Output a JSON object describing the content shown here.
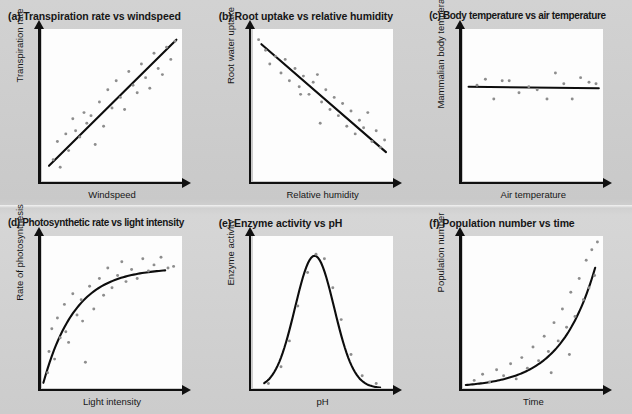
{
  "figure": {
    "background_color": "#cfcfcf",
    "plot_background_color": "#fdfdfd",
    "axis_color": "#101010",
    "dot_color": "#8d8d8d",
    "trend_color": "#0d0d0d"
  },
  "chart_data": [
    {
      "type": "scatter",
      "panel": "a",
      "title": "(a) Transpiration rate vs windspeed",
      "xlabel": "Windspeed",
      "ylabel": "Transpiration rate",
      "relationship": "positive linear",
      "grid": false,
      "legend": "none",
      "xlim": [
        0,
        100
      ],
      "ylim": [
        0,
        100
      ],
      "points": [
        [
          8,
          14
        ],
        [
          11,
          26
        ],
        [
          13,
          9
        ],
        [
          17,
          31
        ],
        [
          19,
          20
        ],
        [
          22,
          41
        ],
        [
          24,
          33
        ],
        [
          27,
          29
        ],
        [
          30,
          45
        ],
        [
          32,
          38
        ],
        [
          35,
          43
        ],
        [
          38,
          24
        ],
        [
          41,
          52
        ],
        [
          44,
          36
        ],
        [
          47,
          60
        ],
        [
          50,
          48
        ],
        [
          53,
          66
        ],
        [
          56,
          55
        ],
        [
          59,
          47
        ],
        [
          62,
          72
        ],
        [
          65,
          63
        ],
        [
          68,
          58
        ],
        [
          71,
          77
        ],
        [
          74,
          68
        ],
        [
          77,
          61
        ],
        [
          80,
          84
        ],
        [
          83,
          74
        ],
        [
          86,
          70
        ],
        [
          89,
          88
        ],
        [
          92,
          80
        ],
        [
          95,
          92
        ]
      ],
      "trend": {
        "kind": "line",
        "from": [
          5,
          10
        ],
        "to": [
          96,
          93
        ]
      }
    },
    {
      "type": "scatter",
      "panel": "b",
      "title": "(b) Root uptake vs relative humidity",
      "xlabel": "Relative humidity",
      "ylabel": "Root water uptake",
      "relationship": "negative linear",
      "grid": false,
      "legend": "none",
      "xlim": [
        0,
        100
      ],
      "ylim": [
        0,
        100
      ],
      "points": [
        [
          4,
          93
        ],
        [
          9,
          86
        ],
        [
          12,
          77
        ],
        [
          16,
          82
        ],
        [
          20,
          71
        ],
        [
          23,
          80
        ],
        [
          26,
          66
        ],
        [
          30,
          74
        ],
        [
          33,
          62
        ],
        [
          36,
          69
        ],
        [
          40,
          57
        ],
        [
          43,
          65
        ],
        [
          46,
          70
        ],
        [
          49,
          52
        ],
        [
          52,
          60
        ],
        [
          55,
          47
        ],
        [
          58,
          55
        ],
        [
          61,
          43
        ],
        [
          64,
          51
        ],
        [
          67,
          36
        ],
        [
          70,
          46
        ],
        [
          73,
          31
        ],
        [
          76,
          40
        ],
        [
          79,
          35
        ],
        [
          82,
          45
        ],
        [
          85,
          26
        ],
        [
          88,
          33
        ],
        [
          91,
          22
        ],
        [
          94,
          27
        ],
        [
          48,
          38
        ],
        [
          34,
          57
        ]
      ],
      "trend": {
        "kind": "line",
        "from": [
          6,
          90
        ],
        "to": [
          95,
          19
        ]
      }
    },
    {
      "type": "scatter",
      "panel": "c",
      "title": "(c) Body temperature vs air temperature",
      "xlabel": "Air temperature",
      "ylabel": "Mammalian body temperature",
      "relationship": "no correlation (constant)",
      "grid": false,
      "legend": "none",
      "xlim": [
        0,
        100
      ],
      "ylim": [
        0,
        100
      ],
      "points": [
        [
          10,
          63
        ],
        [
          16,
          67
        ],
        [
          22,
          54
        ],
        [
          28,
          66
        ],
        [
          33,
          66
        ],
        [
          40,
          58
        ],
        [
          47,
          62
        ],
        [
          53,
          60
        ],
        [
          60,
          54
        ],
        [
          66,
          71
        ],
        [
          72,
          64
        ],
        [
          78,
          54
        ],
        [
          84,
          68
        ],
        [
          90,
          65
        ],
        [
          95,
          64
        ]
      ],
      "trend": {
        "kind": "line",
        "from": [
          4,
          62
        ],
        "to": [
          97,
          61
        ]
      }
    },
    {
      "type": "scatter",
      "panel": "d",
      "title": "(d) Photosynthetic rate vs light intensity",
      "xlabel": "Light intensity",
      "ylabel": "Rate of photosynthesis",
      "relationship": "rises then plateaus (saturation)",
      "grid": false,
      "legend": "none",
      "xlim": [
        0,
        100
      ],
      "ylim": [
        0,
        100
      ],
      "points": [
        [
          4,
          10
        ],
        [
          5,
          24
        ],
        [
          7,
          39
        ],
        [
          9,
          19
        ],
        [
          11,
          46
        ],
        [
          13,
          33
        ],
        [
          16,
          55
        ],
        [
          19,
          30
        ],
        [
          22,
          62
        ],
        [
          25,
          48
        ],
        [
          28,
          58
        ],
        [
          31,
          17
        ],
        [
          34,
          67
        ],
        [
          37,
          52
        ],
        [
          41,
          72
        ],
        [
          44,
          61
        ],
        [
          47,
          79
        ],
        [
          50,
          66
        ],
        [
          54,
          74
        ],
        [
          57,
          83
        ],
        [
          60,
          70
        ],
        [
          64,
          78
        ],
        [
          68,
          72
        ],
        [
          72,
          85
        ],
        [
          76,
          77
        ],
        [
          80,
          81
        ],
        [
          85,
          86
        ],
        [
          90,
          79
        ],
        [
          94,
          80
        ],
        [
          29,
          44
        ],
        [
          17,
          37
        ]
      ],
      "trend": {
        "kind": "saturation",
        "plateau": 79,
        "rate": 4.2
      }
    },
    {
      "type": "scatter",
      "panel": "e",
      "title": "(e) Enzyme activity vs pH",
      "xlabel": "pH",
      "ylabel": "Enzyme activity",
      "relationship": "optimum (bell curve)",
      "grid": false,
      "legend": "none",
      "xlim": [
        0,
        100
      ],
      "ylim": [
        0,
        100
      ],
      "points": [
        [
          11,
          3
        ],
        [
          20,
          14
        ],
        [
          26,
          31
        ],
        [
          32,
          54
        ],
        [
          39,
          76
        ],
        [
          45,
          88
        ],
        [
          51,
          85
        ],
        [
          57,
          66
        ],
        [
          63,
          45
        ],
        [
          70,
          22
        ],
        [
          78,
          8
        ],
        [
          88,
          3
        ]
      ],
      "trend": {
        "kind": "gaussian",
        "peak_x": 44,
        "peak_y": 87,
        "width": 14
      }
    },
    {
      "type": "scatter",
      "panel": "f",
      "title": "(f) Population number vs time",
      "xlabel": "Time",
      "ylabel": "Population number",
      "relationship": "exponential growth",
      "grid": false,
      "legend": "none",
      "xlim": [
        0,
        100
      ],
      "ylim": [
        0,
        100
      ],
      "points": [
        [
          8,
          5
        ],
        [
          14,
          9
        ],
        [
          19,
          4
        ],
        [
          24,
          12
        ],
        [
          29,
          8
        ],
        [
          34,
          16
        ],
        [
          38,
          6
        ],
        [
          42,
          20
        ],
        [
          46,
          13
        ],
        [
          50,
          27
        ],
        [
          54,
          18
        ],
        [
          58,
          34
        ],
        [
          61,
          24
        ],
        [
          65,
          43
        ],
        [
          68,
          31
        ],
        [
          71,
          52
        ],
        [
          74,
          40
        ],
        [
          77,
          63
        ],
        [
          80,
          47
        ],
        [
          83,
          72
        ],
        [
          86,
          58
        ],
        [
          88,
          84
        ],
        [
          90,
          66
        ],
        [
          92,
          91
        ],
        [
          94,
          74
        ],
        [
          96,
          96
        ],
        [
          63,
          10
        ],
        [
          76,
          22
        ]
      ],
      "trend": {
        "kind": "exponential",
        "base_y": 2,
        "growth": 4.0
      }
    }
  ]
}
